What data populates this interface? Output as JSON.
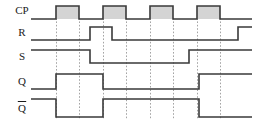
{
  "figure": {
    "kind": "timing-diagram",
    "width": 258,
    "height": 128,
    "background_color": "#ffffff",
    "wave_color": "#3a3a3a",
    "pulse_fill_color": "#d4d4d4",
    "gridline_color": "#9a9a9a"
  },
  "signals": [
    {
      "name": "CP",
      "label": "CP",
      "has_overline": false,
      "row_index": 0,
      "label_x": 22,
      "label_y": 11,
      "high_y": 6,
      "low_y": 19,
      "start_x": 31,
      "end_x": 252,
      "shaded": true,
      "initial_level": 0,
      "transitions": [
        56,
        79,
        103,
        126,
        150,
        173,
        197,
        220
      ],
      "pulses": [
        {
          "start": 56,
          "end": 79
        },
        {
          "start": 103,
          "end": 126
        },
        {
          "start": 150,
          "end": 173
        },
        {
          "start": 197,
          "end": 220
        }
      ]
    },
    {
      "name": "R",
      "label": "R",
      "has_overline": false,
      "row_index": 1,
      "label_x": 22,
      "label_y": 33,
      "high_y": 27,
      "low_y": 40,
      "start_x": 31,
      "end_x": 252,
      "shaded": false,
      "initial_level": 0,
      "transitions": [
        90,
        112,
        238
      ]
    },
    {
      "name": "S",
      "label": "S",
      "has_overline": false,
      "row_index": 2,
      "label_x": 22,
      "label_y": 57,
      "high_y": 50,
      "low_y": 63,
      "start_x": 31,
      "end_x": 252,
      "shaded": false,
      "initial_level": 1,
      "transitions": [
        90,
        189
      ]
    },
    {
      "name": "Q",
      "label": "Q",
      "has_overline": false,
      "row_index": 3,
      "label_x": 22,
      "label_y": 82,
      "high_y": 74,
      "low_y": 89,
      "start_x": 31,
      "end_x": 252,
      "shaded": false,
      "initial_level": 0,
      "transitions": [
        56,
        103,
        199
      ]
    },
    {
      "name": "Qbar",
      "label": "Q",
      "has_overline": true,
      "row_index": 4,
      "label_x": 22,
      "label_y": 109,
      "high_y": 99,
      "low_y": 117,
      "start_x": 31,
      "end_x": 252,
      "shaded": false,
      "initial_level": 1,
      "transitions": [
        56,
        103,
        199
      ]
    }
  ],
  "gridlines": {
    "x_positions": [
      56,
      79,
      103,
      126,
      150,
      173,
      197,
      220
    ],
    "y_top": 18,
    "y_bottom": 120
  }
}
